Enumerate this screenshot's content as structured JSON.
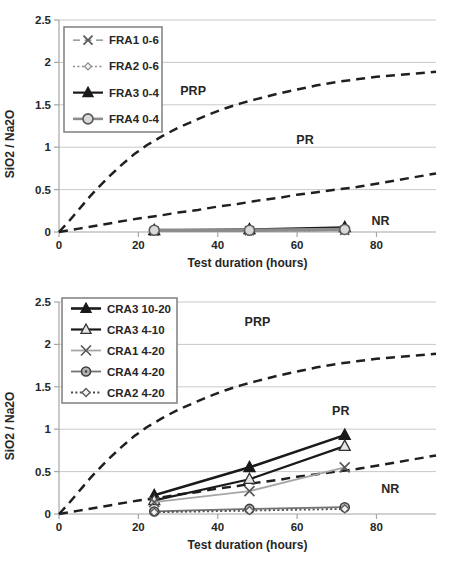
{
  "page": {
    "background": "#ffffff"
  },
  "styles": {
    "axis_text_color": "#262626",
    "grid_color": "#c9c9c9",
    "axis_line_color": "#a6a6a6",
    "boundary_color": "#1f1f1f",
    "legend_border_color": "#7f7f7f",
    "legend_fill": "#ffffff"
  },
  "chart_data": [
    {
      "type": "line",
      "title": "",
      "xlabel": "Test duration (hours)",
      "ylabel": "SiO2 / Na2O",
      "xlim": [
        0,
        95
      ],
      "ylim": [
        0,
        2.5
      ],
      "xticks": [
        0,
        20,
        40,
        60,
        80
      ],
      "xtick_labels": [
        "0",
        "20",
        "40",
        "60",
        "80"
      ],
      "yticks": [
        0,
        0.5,
        1,
        1.5,
        2,
        2.5
      ],
      "ytick_labels": [
        "0",
        "0.5",
        "1",
        "1.5",
        "2",
        "2.5"
      ],
      "grid": "horizontal-only",
      "legend_position": "top-left",
      "legend_box": {
        "x": 64,
        "y": 27,
        "w": 98,
        "h": 105
      },
      "x": [
        24,
        48,
        72
      ],
      "series": [
        {
          "name": "FRA1 0-6",
          "marker": "x",
          "line": "dashed",
          "color": "#7f7f7f",
          "marker_color": "#595959",
          "marker_fill": "none",
          "width": 1.4,
          "marker_size": 4.5,
          "values": [
            0.01,
            0.015,
            0.02
          ]
        },
        {
          "name": "FRA2 0-6",
          "marker": "diamond-open",
          "line": "dotted",
          "color": "#8c8c8c",
          "marker_color": "#8c8c8c",
          "marker_fill": "#f2f2f2",
          "width": 1.5,
          "marker_size": 3.5,
          "values": [
            0.01,
            0.012,
            0.018
          ]
        },
        {
          "name": "FRA3 0-4",
          "marker": "triangle-filled",
          "line": "solid",
          "color": "#1a1a1a",
          "marker_color": "#1a1a1a",
          "marker_fill": "#1a1a1a",
          "width": 2.2,
          "marker_size": 6,
          "values": [
            0.02,
            0.03,
            0.055
          ]
        },
        {
          "name": "FRA4 0-4",
          "marker": "circle-open",
          "line": "solid",
          "color": "#8c8c8c",
          "marker_color": "#595959",
          "marker_fill": "#d9d9d9",
          "width": 3.5,
          "marker_size": 5,
          "values": [
            0.02,
            0.02,
            0.03
          ]
        }
      ],
      "boundaries": [
        {
          "name": "PRP",
          "x": [
            0,
            2,
            4,
            6,
            8,
            10,
            13,
            16,
            19,
            22,
            26,
            30,
            34,
            38,
            42,
            46,
            50,
            55,
            60,
            65,
            70,
            75,
            80,
            85,
            90,
            95
          ],
          "y": [
            0,
            0.1,
            0.21,
            0.32,
            0.43,
            0.53,
            0.67,
            0.8,
            0.92,
            1.02,
            1.13,
            1.23,
            1.31,
            1.39,
            1.46,
            1.52,
            1.57,
            1.63,
            1.68,
            1.73,
            1.77,
            1.8,
            1.83,
            1.85,
            1.87,
            1.89
          ]
        },
        {
          "name": "PR",
          "x": [
            0,
            5,
            10,
            15,
            20,
            25,
            30,
            35,
            40,
            45,
            50,
            55,
            60,
            65,
            70,
            75,
            80,
            85,
            90,
            95
          ],
          "y": [
            0,
            0.04,
            0.08,
            0.12,
            0.16,
            0.19,
            0.23,
            0.26,
            0.3,
            0.33,
            0.37,
            0.4,
            0.44,
            0.47,
            0.5,
            0.53,
            0.57,
            0.61,
            0.65,
            0.69
          ]
        }
      ],
      "region_labels": [
        {
          "text": "PRP",
          "x": 33.8,
          "y": 1.66
        },
        {
          "text": "PR",
          "x": 62,
          "y": 1.08
        },
        {
          "text": "NR",
          "x": 81,
          "y": 0.13
        }
      ]
    },
    {
      "type": "line",
      "title": "",
      "xlabel": "Test duration (hours)",
      "ylabel": "SiO2 / Na2O",
      "xlim": [
        0,
        95
      ],
      "ylim": [
        0,
        2.5
      ],
      "xticks": [
        0,
        20,
        40,
        60,
        80
      ],
      "xtick_labels": [
        "0",
        "20",
        "40",
        "60",
        "80"
      ],
      "yticks": [
        0,
        0.5,
        1,
        1.5,
        2,
        2.5
      ],
      "ytick_labels": [
        "0",
        "0.5",
        "1",
        "1.5",
        "2",
        "2.5"
      ],
      "grid": "horizontal-only",
      "legend_position": "top-left",
      "legend_box": {
        "x": 62,
        "y": 16,
        "w": 115,
        "h": 105
      },
      "x": [
        24,
        48,
        72
      ],
      "series": [
        {
          "name": "CRA3 10-20",
          "marker": "triangle-filled",
          "line": "solid",
          "color": "#1a1a1a",
          "marker_color": "#1a1a1a",
          "marker_fill": "#1a1a1a",
          "width": 2.6,
          "marker_size": 6,
          "values": [
            0.22,
            0.55,
            0.93
          ]
        },
        {
          "name": "CRA3 4-10",
          "marker": "triangle-open",
          "line": "solid",
          "color": "#1a1a1a",
          "marker_color": "#333333",
          "marker_fill": "#e6e6e6",
          "width": 2.2,
          "marker_size": 6,
          "values": [
            0.16,
            0.41,
            0.8
          ]
        },
        {
          "name": "CRA1 4-20",
          "marker": "x",
          "line": "solid",
          "color": "#a6a6a6",
          "marker_color": "#595959",
          "marker_fill": "none",
          "width": 1.8,
          "marker_size": 5,
          "values": [
            0.14,
            0.27,
            0.55
          ]
        },
        {
          "name": "CRA4 4-20",
          "marker": "circle-filled",
          "line": "solid",
          "color": "#737373",
          "marker_color": "#404040",
          "marker_fill": "#b3b3b3",
          "width": 1.8,
          "marker_size": 4.5,
          "values": [
            0.03,
            0.06,
            0.08
          ]
        },
        {
          "name": "CRA2 4-20",
          "marker": "diamond-open",
          "line": "dotted",
          "color": "#4d4d4d",
          "marker_color": "#595959",
          "marker_fill": "#f2f2f2",
          "width": 1.8,
          "marker_size": 4,
          "values": [
            0.02,
            0.04,
            0.06
          ]
        }
      ],
      "boundaries": [
        {
          "name": "PRP",
          "x": [
            0,
            2,
            4,
            6,
            8,
            10,
            13,
            16,
            19,
            22,
            26,
            30,
            34,
            38,
            42,
            46,
            50,
            55,
            60,
            65,
            70,
            75,
            80,
            85,
            90,
            95
          ],
          "y": [
            0,
            0.1,
            0.21,
            0.32,
            0.43,
            0.53,
            0.67,
            0.8,
            0.92,
            1.02,
            1.13,
            1.23,
            1.31,
            1.39,
            1.46,
            1.52,
            1.57,
            1.63,
            1.68,
            1.73,
            1.77,
            1.8,
            1.83,
            1.85,
            1.87,
            1.89
          ]
        },
        {
          "name": "PR",
          "x": [
            0,
            5,
            10,
            15,
            20,
            25,
            30,
            35,
            40,
            45,
            50,
            55,
            60,
            65,
            70,
            75,
            80,
            85,
            90,
            95
          ],
          "y": [
            0,
            0.04,
            0.08,
            0.12,
            0.16,
            0.19,
            0.23,
            0.26,
            0.3,
            0.33,
            0.37,
            0.4,
            0.44,
            0.47,
            0.5,
            0.53,
            0.57,
            0.61,
            0.65,
            0.69
          ]
        }
      ],
      "region_labels": [
        {
          "text": "PRP",
          "x": 50,
          "y": 2.27
        },
        {
          "text": "PR",
          "x": 71,
          "y": 1.22
        },
        {
          "text": "NR",
          "x": 83.5,
          "y": 0.3
        }
      ]
    }
  ]
}
